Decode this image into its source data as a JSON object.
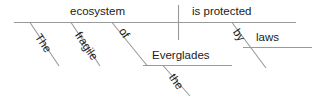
{
  "diagram": {
    "type": "reed-kellogg-sentence-diagram",
    "sentence": "The fragile ecosystem of the Everglades is protected by laws",
    "line_color": "#9a9a9a",
    "text_color": "#1a1a1a",
    "background": "#ffffff",
    "baseline": {
      "subject": "ecosystem",
      "predicate": "is protected"
    },
    "modifiers": [
      {
        "word": "The",
        "attaches_to": "ecosystem",
        "orientation": "slanted"
      },
      {
        "word": "fragile",
        "attaches_to": "ecosystem",
        "orientation": "slanted"
      },
      {
        "word": "of",
        "attaches_to": "ecosystem",
        "orientation": "slanted",
        "role": "preposition"
      },
      {
        "word": "Everglades",
        "attaches_to": "of",
        "orientation": "horizontal",
        "role": "object-of-preposition"
      },
      {
        "word": "the",
        "attaches_to": "Everglades",
        "orientation": "slanted"
      },
      {
        "word": "by",
        "attaches_to": "is protected",
        "orientation": "slanted",
        "role": "preposition"
      },
      {
        "word": "laws",
        "attaches_to": "by",
        "orientation": "horizontal",
        "role": "object-of-preposition"
      }
    ],
    "labels": {
      "subject": "ecosystem",
      "predicate": "is protected",
      "det_subject": "The",
      "adj_subject": "fragile",
      "prep_subject": "of",
      "prep_object_subject": "Everglades",
      "det_prep_object": "the",
      "prep_predicate": "by",
      "prep_object_predicate": "laws"
    }
  }
}
